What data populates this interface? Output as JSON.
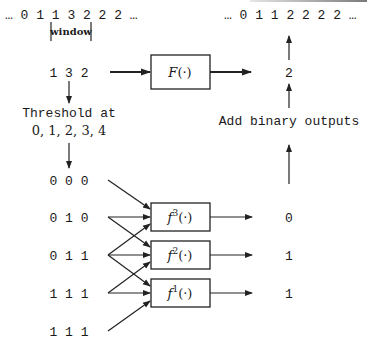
{
  "diagram": {
    "input_sequence": "… 0 1 1 3 2 2 2 …",
    "output_sequence": "… 0 1 1 2 2 2 2 …",
    "window_label": "window",
    "window_values": "1 3 2",
    "main_filter": {
      "name": "F",
      "args": "(·)"
    },
    "main_output": "2",
    "threshold_label_line1": "Threshold at",
    "threshold_label_line2": "0, 1, 2, 3, 4",
    "add_label": "Add binary outputs",
    "binary_rows": [
      "0 0 0",
      "0 1 0",
      "0 1 1",
      "1 1 1",
      "1 1 1"
    ],
    "stack_filters": [
      {
        "name": "f",
        "sup": "3",
        "args": "(·)",
        "output": "0"
      },
      {
        "name": "f",
        "sup": "2",
        "args": "(·)",
        "output": "1"
      },
      {
        "name": "f",
        "sup": "1",
        "args": "(·)",
        "output": "1"
      }
    ]
  }
}
